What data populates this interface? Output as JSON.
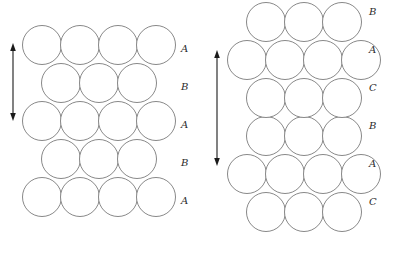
{
  "figure": {
    "width": 398,
    "height": 264,
    "background": "#ffffff",
    "sphere_stroke": "#555555",
    "sphere_fill": "#ffffff",
    "arrow_color": "#1a1a1a",
    "label_color": "#2b2b2b"
  },
  "diagrams": [
    {
      "id": "hcp",
      "name": "hexagonal-close-packed-stacking",
      "sequence": "ABABA",
      "radius": 19.5,
      "arrow": {
        "x": 13,
        "y_top": 43,
        "y_bottom": 121
      },
      "label_x": 181,
      "layers": [
        {
          "label": "A",
          "cy": 45,
          "label_y": 44,
          "centers_x": [
            42,
            80,
            118,
            156
          ]
        },
        {
          "label": "B",
          "cy": 83,
          "label_y": 82,
          "centers_x": [
            61,
            99,
            137
          ]
        },
        {
          "label": "A",
          "cy": 121,
          "label_y": 120,
          "centers_x": [
            42,
            80,
            118,
            156
          ]
        },
        {
          "label": "B",
          "cy": 159,
          "label_y": 158,
          "centers_x": [
            61,
            99,
            137
          ]
        },
        {
          "label": "A",
          "cy": 197,
          "label_y": 196,
          "centers_x": [
            42,
            80,
            118,
            156
          ]
        }
      ]
    },
    {
      "id": "fcc",
      "name": "cubic-close-packed-stacking",
      "sequence": "BACBAC",
      "radius": 19.5,
      "arrow": {
        "x": 217,
        "y_top": 50,
        "y_bottom": 166
      },
      "label_x": 369,
      "layers": [
        {
          "label": "B",
          "cy": 22,
          "label_y": 7,
          "centers_x": [
            266,
            304,
            342
          ]
        },
        {
          "label": "A",
          "cy": 60,
          "label_y": 45,
          "centers_x": [
            247,
            285,
            323,
            361
          ]
        },
        {
          "label": "C",
          "cy": 98,
          "label_y": 83,
          "centers_x": [
            266,
            304,
            342
          ]
        },
        {
          "label": "B",
          "cy": 136,
          "label_y": 121,
          "centers_x": [
            266,
            304,
            342
          ]
        },
        {
          "label": "A",
          "cy": 174,
          "label_y": 159,
          "centers_x": [
            247,
            285,
            323,
            361
          ]
        },
        {
          "label": "C",
          "cy": 212,
          "label_y": 197,
          "centers_x": [
            266,
            304,
            342
          ]
        }
      ]
    }
  ]
}
